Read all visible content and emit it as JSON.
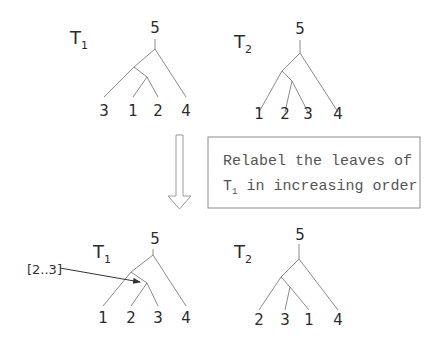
{
  "colors": {
    "edge": "#8a8a8a",
    "text": "#2b2b2b",
    "note_text": "#555555",
    "note_border": "#8c8c8c"
  },
  "trees": [
    {
      "id": "top-t1",
      "name": "T",
      "subscript": "1",
      "name_pos": [
        70,
        44
      ],
      "root_label": "5",
      "root_label_pos": [
        155,
        33
      ],
      "edges": [
        [
          155,
          39,
          155,
          49
        ],
        [
          155,
          49,
          134,
          67
        ],
        [
          155,
          49,
          186,
          97
        ],
        [
          134,
          67,
          104,
          97
        ],
        [
          134,
          67,
          147,
          77
        ],
        [
          147,
          77,
          133,
          97
        ],
        [
          147,
          77,
          158,
          97
        ]
      ],
      "leaves": [
        {
          "label": "3",
          "x": 104,
          "y": 116
        },
        {
          "label": "1",
          "x": 133,
          "y": 116
        },
        {
          "label": "2",
          "x": 158,
          "y": 116
        },
        {
          "label": "4",
          "x": 186,
          "y": 116
        }
      ]
    },
    {
      "id": "top-t2",
      "name": "T",
      "subscript": "2",
      "name_pos": [
        234,
        48
      ],
      "root_label": "5",
      "root_label_pos": [
        300,
        34
      ],
      "edges": [
        [
          300,
          40,
          300,
          53
        ],
        [
          300,
          53,
          282,
          71
        ],
        [
          300,
          53,
          338,
          112
        ],
        [
          282,
          71,
          259,
          112
        ],
        [
          282,
          71,
          292,
          81
        ],
        [
          292,
          81,
          285,
          112
        ],
        [
          292,
          81,
          308,
          112
        ]
      ],
      "leaves": [
        {
          "label": "1",
          "x": 259,
          "y": 119
        },
        {
          "label": "2",
          "x": 285,
          "y": 119
        },
        {
          "label": "3",
          "x": 308,
          "y": 119
        },
        {
          "label": "4",
          "x": 338,
          "y": 119
        }
      ]
    },
    {
      "id": "bottom-t1",
      "name": "T",
      "subscript": "1",
      "name_pos": [
        93,
        258
      ],
      "root_label": "5",
      "root_label_pos": [
        155,
        244
      ],
      "edges": [
        [
          153,
          249,
          153,
          255
        ],
        [
          153,
          255,
          131,
          272
        ],
        [
          153,
          255,
          186,
          306
        ],
        [
          131,
          272,
          103,
          306
        ],
        [
          131,
          272,
          147,
          283
        ],
        [
          147,
          283,
          131,
          306
        ],
        [
          147,
          283,
          158,
          306
        ]
      ],
      "leaves": [
        {
          "label": "1",
          "x": 103,
          "y": 323
        },
        {
          "label": "2",
          "x": 131,
          "y": 323
        },
        {
          "label": "3",
          "x": 158,
          "y": 323
        },
        {
          "label": "4",
          "x": 186,
          "y": 323
        }
      ]
    },
    {
      "id": "bottom-t2",
      "name": "T",
      "subscript": "2",
      "name_pos": [
        234,
        258
      ],
      "root_label": "5",
      "root_label_pos": [
        300,
        240
      ],
      "edges": [
        [
          299,
          244,
          299,
          259
        ],
        [
          299,
          259,
          281,
          277
        ],
        [
          299,
          259,
          338,
          310
        ],
        [
          281,
          277,
          259,
          310
        ],
        [
          281,
          277,
          290,
          287
        ],
        [
          290,
          287,
          285,
          310
        ],
        [
          290,
          287,
          309,
          310
        ]
      ],
      "leaves": [
        {
          "label": "2",
          "x": 259,
          "y": 325
        },
        {
          "label": "3",
          "x": 285,
          "y": 325
        },
        {
          "label": "1",
          "x": 309,
          "y": 325
        },
        {
          "label": "4",
          "x": 338,
          "y": 325
        }
      ]
    }
  ],
  "transition_arrow": {
    "shaft": [
      176,
      135,
      183,
      196
    ],
    "head": [
      168,
      196,
      191,
      196,
      179.5,
      209
    ]
  },
  "note": {
    "box": [
      208,
      137,
      212,
      71
    ],
    "line1": "Relabel the leaves of",
    "line2_main": "T",
    "line2_sub": "1",
    "line2_rest": " in increasing order"
  },
  "callout": {
    "label": "[2..3]",
    "label_pos": [
      27,
      274
    ],
    "line": [
      60,
      268,
      140,
      282
    ]
  }
}
